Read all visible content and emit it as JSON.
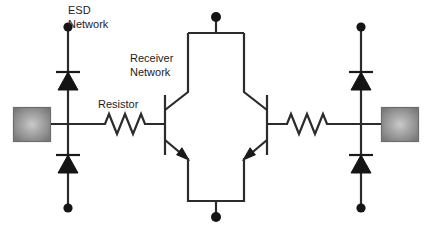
{
  "diagram": {
    "background_color": "#ffffff",
    "wire_color": "#2b2b2b",
    "pad_color": "#8a8a8a",
    "labels": [
      {
        "id": "esd_network",
        "text_line1": "ESD",
        "text_line2": "Network",
        "x": 68,
        "y": 14
      },
      {
        "id": "receiver_network",
        "text_line1": "Receiver",
        "text_line2": "Network",
        "x": 130,
        "y": 62
      },
      {
        "id": "resistor",
        "text_line1": "Resistor",
        "text_line2": "",
        "x": 98,
        "y": 108
      }
    ],
    "components": {
      "pads": [
        {
          "id": "pad-left",
          "x": 13,
          "y": 107,
          "w": 38,
          "h": 35
        },
        {
          "id": "pad-right",
          "x": 381,
          "y": 107,
          "w": 38,
          "h": 35
        }
      ],
      "diodes": [
        {
          "id": "diode-top-left",
          "x": 68,
          "direction": "up",
          "cathode_y": 89,
          "top_y": 30,
          "bottom_y": 124
        },
        {
          "id": "diode-bottom-left",
          "x": 68,
          "direction": "up",
          "cathode_y": 155,
          "top_y": 124,
          "bottom_y": 205
        },
        {
          "id": "diode-top-right",
          "x": 361,
          "direction": "up",
          "cathode_y": 89,
          "top_y": 30,
          "bottom_y": 124
        },
        {
          "id": "diode-bottom-right",
          "x": 361,
          "direction": "up",
          "cathode_y": 155,
          "top_y": 124,
          "bottom_y": 205
        }
      ],
      "resistors": [
        {
          "id": "resistor-left",
          "x1": 100,
          "x2": 152,
          "y": 124
        },
        {
          "id": "resistor-right",
          "x1": 288,
          "x2": 340,
          "y": 124
        }
      ],
      "transistors": [
        {
          "id": "transistor-left",
          "type": "npn",
          "gate_x": 165,
          "orientation": "normal"
        },
        {
          "id": "transistor-right",
          "type": "npn",
          "gate_x": 267,
          "orientation": "mirrored"
        }
      ],
      "terminals": [
        {
          "id": "terminal-top-left",
          "x": 68,
          "y": 27
        },
        {
          "id": "terminal-bottom-left",
          "x": 68,
          "y": 208
        },
        {
          "id": "terminal-top-center",
          "x": 216,
          "y": 17
        },
        {
          "id": "terminal-bottom-center",
          "x": 216,
          "y": 217
        },
        {
          "id": "terminal-top-right",
          "x": 361,
          "y": 27
        },
        {
          "id": "terminal-bottom-right",
          "x": 361,
          "y": 208
        }
      ]
    }
  }
}
